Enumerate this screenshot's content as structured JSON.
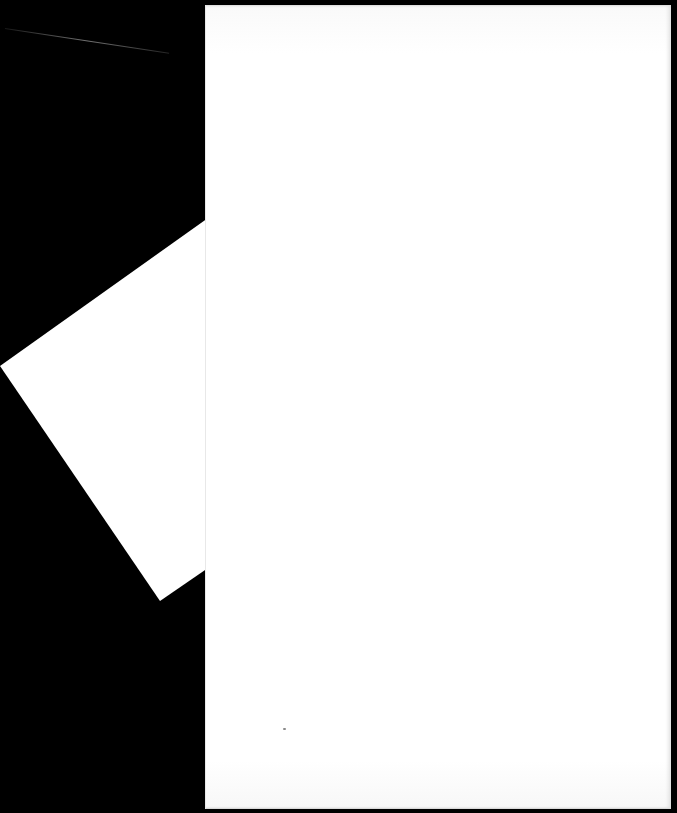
{
  "scene": {
    "description": "Blank white paper sheets on a black background",
    "background_color": "#000000",
    "paper_color": "#ffffff",
    "sheets": [
      {
        "name": "tilted-sheet",
        "polygon": [
          [
            0,
            366
          ],
          [
            205,
            220
          ],
          [
            205,
            566
          ],
          [
            160,
            601
          ]
        ]
      },
      {
        "name": "main-sheet",
        "rect": {
          "x": 205,
          "y": 5,
          "w": 466,
          "h": 804
        }
      }
    ]
  }
}
